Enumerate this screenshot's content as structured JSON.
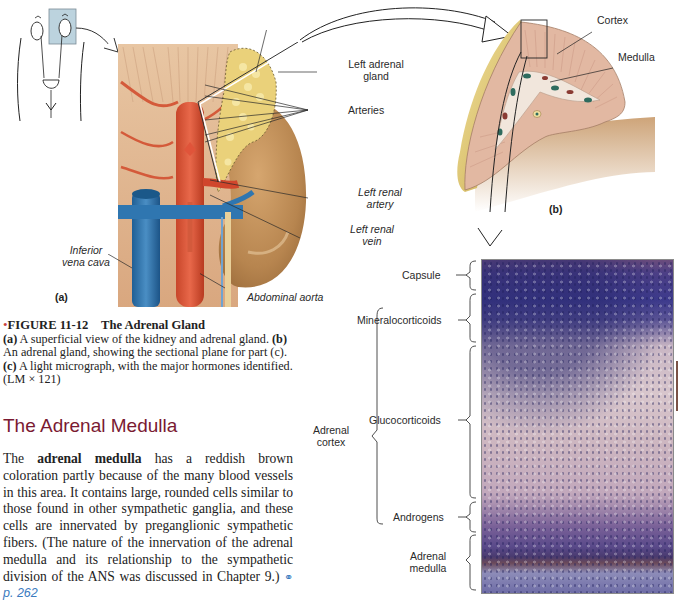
{
  "figure": {
    "number": "FIGURE 11-12",
    "title": "The Adrenal Gland",
    "caption_parts": {
      "a_tag": "(a)",
      "a_text": " A superficial view of the kidney and adrenal gland. ",
      "b_tag": "(b)",
      "b_text": " An adrenal gland, showing the sectional plane for part (c). ",
      "c_tag": "(c)",
      "c_text": " A light micrograph, with the major hormones identified. (LM × 121)"
    },
    "bullet_color": "#c8423b"
  },
  "panel_a": {
    "tag": "(a)",
    "labels": {
      "left_adrenal_gland_line1": "Left adrenal",
      "left_adrenal_gland_line2": "gland",
      "arteries": "Arteries",
      "left_renal_artery_line1": "Left renal",
      "left_renal_artery_line2": "artery",
      "left_renal_vein_line1": "Left renal",
      "left_renal_vein_line2": "vein",
      "inferior_vena_cava_line1": "Inferior",
      "inferior_vena_cava_line2": "vena cava",
      "abdominal_aorta": "Abdominal aorta"
    }
  },
  "panel_b": {
    "tag": "(b)",
    "labels": {
      "cortex": "Cortex",
      "medulla": "Medulla"
    }
  },
  "panel_c": {
    "labels": {
      "capsule": "Capsule",
      "mineralocorticoids": "Mineralocorticoids",
      "adrenal_cortex_line1": "Adrenal",
      "adrenal_cortex_line2": "cortex",
      "glucocorticoids": "Glucocorticoids",
      "androgens": "Androgens",
      "adrenal_medulla_line1": "Adrenal",
      "adrenal_medulla_line2": "medulla"
    }
  },
  "section": {
    "title": "The Adrenal Medulla",
    "title_color": "#7a1a32",
    "body_prefix": "The ",
    "body_bold": "adrenal medulla",
    "body_text": " has a reddish brown coloration partly because of the many blood vessels in this area. It contains large, rounded cells similar to those found in other sympathetic ganglia, and these cells are innervated by preganglionic sympathetic fibers. (The nature of the innervation of the adrenal medulla and its relationship to the sympathetic division of the ANS was discussed in Chapter 9.) ",
    "xref_icon": "link-icon",
    "xref_glyph": "⚭",
    "xref_text": "p. 262",
    "xref_color": "#3a7bbf"
  }
}
